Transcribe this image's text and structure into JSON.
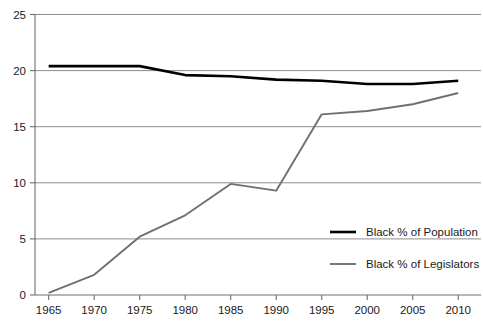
{
  "chart_data": {
    "type": "line",
    "title": "",
    "subtitle": "",
    "xlabel": "",
    "ylabel": "",
    "x": [
      1965,
      1970,
      1975,
      1980,
      1985,
      1990,
      1995,
      2000,
      2005,
      2010
    ],
    "xlim": [
      1963.5,
      2012.5
    ],
    "ylim": [
      0,
      25
    ],
    "xticks": [
      1965,
      1970,
      1975,
      1980,
      1985,
      1990,
      1995,
      2000,
      2005,
      2010
    ],
    "xtick_labels": [
      "1965",
      "1970",
      "1975",
      "1980",
      "1985",
      "1990",
      "1995",
      "2000",
      "2005",
      "2010"
    ],
    "yticks": [
      0,
      5,
      10,
      15,
      20,
      25
    ],
    "ytick_labels": [
      "0",
      "5",
      "10",
      "15",
      "20",
      "25"
    ],
    "grid": "horizontal",
    "legend_position": "center-right",
    "series": [
      {
        "name": "Black % of Population",
        "color": "#000000",
        "values": [
          20.4,
          20.4,
          20.4,
          19.6,
          19.5,
          19.2,
          19.1,
          18.8,
          18.8,
          19.1
        ]
      },
      {
        "name": "Black % of Legislators",
        "color": "#6f7071",
        "values": [
          0.2,
          1.8,
          5.2,
          7.1,
          9.9,
          9.3,
          16.1,
          16.4,
          17.0,
          18.0
        ]
      }
    ],
    "annotations": []
  },
  "legend": {
    "items": [
      {
        "label": "Black % of Population",
        "color": "#000000"
      },
      {
        "label": "Black % of Legislators",
        "color": "#6f7071"
      }
    ]
  }
}
